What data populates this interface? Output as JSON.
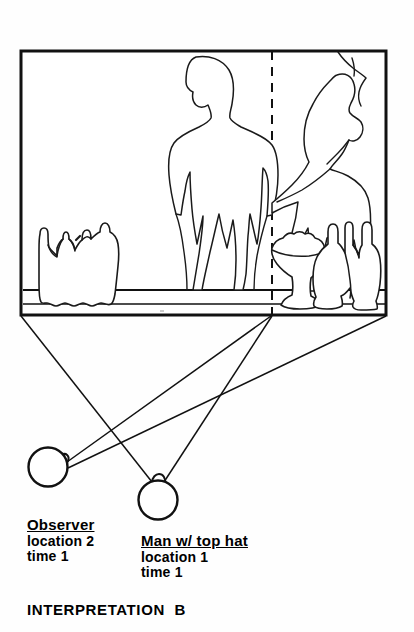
{
  "scene": {
    "caption": "INTERPRETATION  B",
    "panel": {
      "name": "viewpoint-scene-panel",
      "divider_style": "dashed"
    }
  },
  "labels": [
    {
      "id": "observer",
      "title": "Observer",
      "line1": "location 2",
      "line2": "time 1"
    },
    {
      "id": "man-with-top-hat",
      "title": "Man w/ top hat",
      "line1": "location 1",
      "line2": "time 1"
    }
  ],
  "colors": {
    "ink": "#111111",
    "paper": "#fefefe",
    "outline": "#1a1a1a"
  }
}
